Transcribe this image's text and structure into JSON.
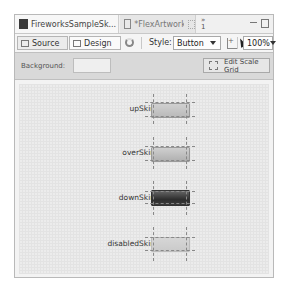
{
  "tabs": [
    {
      "label": "FireworksSampleSk...",
      "icon": "document-icon",
      "active": true
    },
    {
      "label": "*FlexArtwork.css",
      "icon": "css-file-icon",
      "active": false
    }
  ],
  "tab_overflow": "»\n1",
  "toolbar": {
    "source_label": "Source",
    "design_label": "Design",
    "style_label": "Style:",
    "style_value": "Button",
    "zoom_value": "100%"
  },
  "background_bar": {
    "label": "Background:",
    "value": "",
    "edit_scale_grid_label": "Edit Scale Grid"
  },
  "skins": [
    {
      "label": "upSkin",
      "state": "up"
    },
    {
      "label": "overSkin",
      "state": "over"
    },
    {
      "label": "downSkin",
      "state": "down"
    },
    {
      "label": "disabledSkin",
      "state": "disabled"
    }
  ]
}
